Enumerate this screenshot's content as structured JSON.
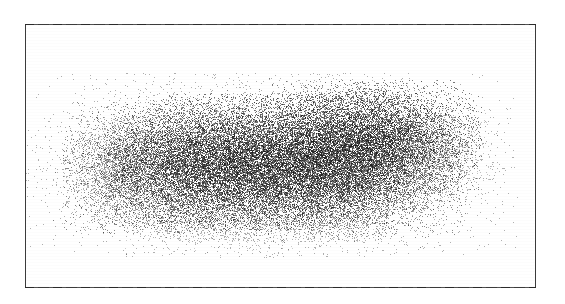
{
  "figure": {
    "type": "scanned-figure",
    "title": "",
    "background_color": "#ffffff",
    "frame": {
      "color": "#3b3b3b",
      "x": 25,
      "y": 24,
      "width": 511,
      "height": 264,
      "line_width": 1
    }
  },
  "chart_data": {
    "type": "scatter",
    "title": "",
    "subtitle": "",
    "xlabel": "",
    "ylabel": "",
    "xlim": [
      0,
      511
    ],
    "ylim": [
      0,
      264
    ],
    "grid": false,
    "legend": null,
    "tick_labels": {
      "x": [],
      "y": []
    },
    "annotations": [],
    "marker": {
      "shape": "dot",
      "size_px": 1,
      "color": "#171717",
      "opacity": 0.5
    },
    "point_count": 46000,
    "clusters": [
      {
        "name": "core-center",
        "cx": 262,
        "cy": 162,
        "sx": 66,
        "sy": 31,
        "weight": 0.26,
        "opacity": 0.62
      },
      {
        "name": "core-left",
        "cx": 183,
        "cy": 168,
        "sx": 52,
        "sy": 30,
        "weight": 0.15,
        "opacity": 0.52
      },
      {
        "name": "core-right-upper",
        "cx": 372,
        "cy": 137,
        "sx": 48,
        "sy": 26,
        "weight": 0.17,
        "opacity": 0.58
      },
      {
        "name": "core-right-lower",
        "cx": 348,
        "cy": 180,
        "sx": 52,
        "sy": 26,
        "weight": 0.13,
        "opacity": 0.5
      },
      {
        "name": "halo-broad",
        "cx": 270,
        "cy": 165,
        "sx": 108,
        "sy": 42,
        "weight": 0.19,
        "opacity": 0.34
      },
      {
        "name": "tip-left",
        "cx": 124,
        "cy": 172,
        "sx": 27,
        "sy": 26,
        "weight": 0.05,
        "opacity": 0.3
      },
      {
        "name": "tail-right",
        "cx": 432,
        "cy": 152,
        "sx": 26,
        "sy": 20,
        "weight": 0.03,
        "opacity": 0.26
      },
      {
        "name": "fringe-bottom",
        "cx": 247,
        "cy": 218,
        "sx": 60,
        "sy": 16,
        "weight": 0.02,
        "opacity": 0.22
      }
    ],
    "extent": {
      "x_min": 95,
      "x_max": 462,
      "y_min": 96,
      "y_max": 243,
      "densest_x_range": [
        210,
        400
      ],
      "densest_y_range": [
        135,
        195
      ]
    }
  }
}
